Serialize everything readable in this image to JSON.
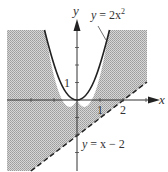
{
  "figure": {
    "type": "inequality-region-graph",
    "axes": {
      "x_label": "x",
      "y_label": "y",
      "x_ticks": [
        -2,
        -1,
        1,
        2,
        3
      ],
      "y_ticks": [
        -3,
        -2,
        -1,
        1,
        2,
        3
      ],
      "x_tick_labels": [
        "1",
        "2"
      ],
      "y_tick_labels": [
        "1"
      ]
    },
    "curves": [
      {
        "name": "parabola",
        "equation_label": "y = 2x²",
        "label_lhs": "y",
        "label_rhs": "= 2x",
        "label_exp": "2",
        "style": "solid"
      },
      {
        "name": "line",
        "equation_label": "y = x − 2",
        "label_lhs": "y",
        "label_rhs": "= x − 2",
        "style": "dashed"
      }
    ],
    "shaded_region": "y ≤ 2x² and y > x − 2",
    "colors": {
      "shade": "#c8c8c8",
      "shade_dot": "#9a9a9a",
      "curve": "#222222",
      "axis": "#333333"
    }
  }
}
